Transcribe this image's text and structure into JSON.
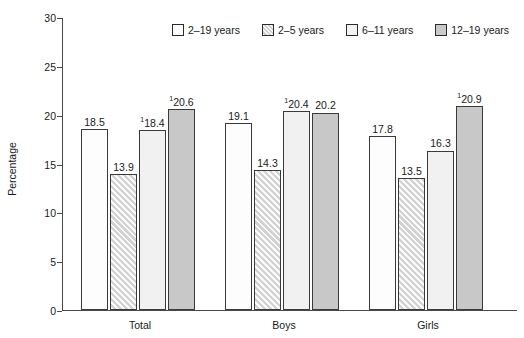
{
  "chart_data": {
    "type": "bar",
    "title": "",
    "xlabel": "",
    "ylabel": "Percentage",
    "ylim": [
      0,
      30
    ],
    "yticks": [
      0,
      5,
      10,
      15,
      20,
      25,
      30
    ],
    "grid": false,
    "legend_position": "top-center",
    "categories": [
      "Total",
      "Boys",
      "Girls"
    ],
    "series": [
      {
        "name": "2–19 years",
        "style": "white",
        "values": [
          18.5,
          19.1,
          17.8
        ],
        "labels": [
          "18.5",
          "19.1",
          "17.8"
        ],
        "footnote_marks": [
          "",
          "",
          ""
        ]
      },
      {
        "name": "2–5 years",
        "style": "hatched-gray",
        "values": [
          13.9,
          14.3,
          13.5
        ],
        "labels": [
          "13.9",
          "14.3",
          "13.5"
        ],
        "footnote_marks": [
          "",
          "",
          ""
        ]
      },
      {
        "name": "6–11 years",
        "style": "light-gray",
        "values": [
          18.4,
          20.4,
          16.3
        ],
        "labels": [
          "18.4",
          "20.4",
          "16.3"
        ],
        "footnote_marks": [
          "1",
          "1",
          ""
        ]
      },
      {
        "name": "12–19 years",
        "style": "medium-gray",
        "values": [
          20.6,
          20.2,
          20.9
        ],
        "labels": [
          "20.6",
          "20.2",
          "20.9"
        ],
        "footnote_marks": [
          "1",
          "",
          "1"
        ]
      }
    ]
  },
  "legend": {
    "items": [
      {
        "label": "2–19 years",
        "swatch": "white"
      },
      {
        "label": "2–5 years",
        "swatch": "hatched-gray"
      },
      {
        "label": "6–11 years",
        "swatch": "light-gray"
      },
      {
        "label": "12–19 years",
        "swatch": "medium-gray"
      }
    ]
  },
  "axis": {
    "y_title": "Percentage",
    "y_tick_labels": [
      "0",
      "5",
      "10",
      "15",
      "20",
      "25",
      "30"
    ],
    "x_tick_labels": [
      "Total",
      "Boys",
      "Girls"
    ]
  },
  "colors": {
    "white_bar": "#fdfdfd",
    "hatch_bar": "#d2d2d2",
    "light_bar": "#f1f1f1",
    "gray_bar": "#c8c8c8",
    "outline": "#3a3a3a",
    "axis": "#4a4a4a",
    "text": "#1a1a1a"
  }
}
